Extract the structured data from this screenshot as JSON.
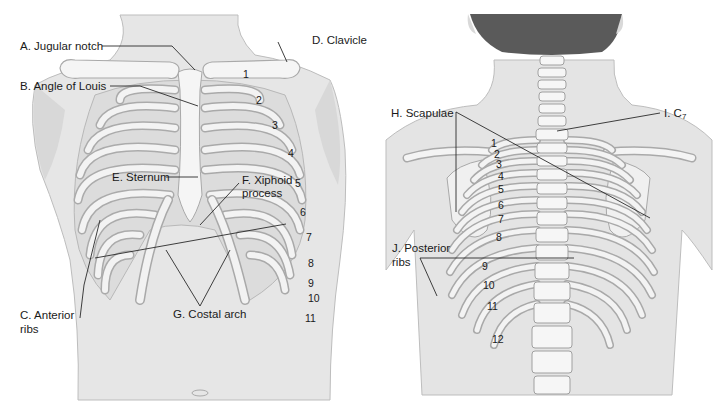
{
  "figure": {
    "top_cut_text": "...page",
    "front_view": {
      "labels": {
        "A": "A. Jugular notch",
        "B": "B. Angle of Louis",
        "C_line1": "C. Anterior",
        "C_line2": "ribs",
        "D": "D. Clavicle",
        "E": "E. Sternum",
        "F_line1": "F. Xiphoid",
        "F_line2": "process",
        "G": "G. Costal arch"
      },
      "rib_numbers": [
        "1",
        "2",
        "3",
        "4",
        "5",
        "6",
        "7",
        "8",
        "9",
        "10",
        "11"
      ]
    },
    "back_view": {
      "labels": {
        "H": "H. Scapulae",
        "I_prefix": "I. C",
        "I_sub": "7",
        "J_line1": "J. Posterior",
        "J_line2": "ribs"
      },
      "rib_numbers": [
        "1",
        "2",
        "3",
        "4",
        "5",
        "6",
        "7",
        "8",
        "9",
        "10",
        "11",
        "12"
      ]
    },
    "colors": {
      "skin": "#e4e4e4",
      "skin_shadow": "#cfcfcf",
      "bone": "#f4f4f4",
      "bone_outline": "#a9a9a9",
      "hair": "#5a5a5a",
      "text": "#1a1a1a",
      "leader_line": "#2a2a2a"
    }
  }
}
